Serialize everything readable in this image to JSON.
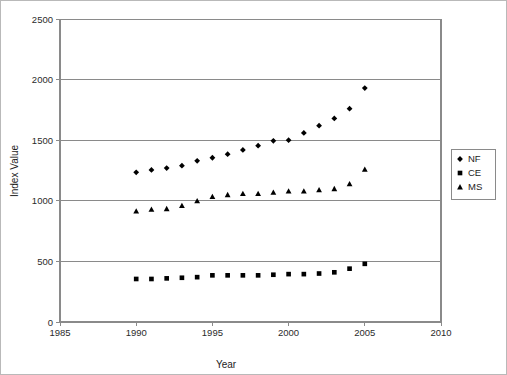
{
  "chart_data": {
    "type": "scatter",
    "title": "",
    "xlabel": "Year",
    "ylabel": "Index Value",
    "xlim": [
      1985,
      2010
    ],
    "ylim": [
      0,
      2500
    ],
    "xticks": [
      1985,
      1990,
      1995,
      2000,
      2005,
      2010
    ],
    "yticks": [
      0,
      500,
      1000,
      1500,
      2000,
      2500
    ],
    "grid": "horizontal",
    "legend_position": "right-outside",
    "x": [
      1990,
      1991,
      1992,
      1993,
      1994,
      1995,
      1996,
      1997,
      1998,
      1999,
      2000,
      2001,
      2002,
      2003,
      2004,
      2005
    ],
    "series": [
      {
        "name": "NF",
        "marker": "diamond",
        "color": "#000000",
        "values": [
          1235,
          1255,
          1270,
          1290,
          1330,
          1355,
          1385,
          1420,
          1455,
          1495,
          1500,
          1560,
          1620,
          1680,
          1760,
          1930
        ]
      },
      {
        "name": "CE",
        "marker": "square",
        "color": "#000000",
        "values": [
          355,
          355,
          360,
          365,
          370,
          385,
          385,
          385,
          385,
          390,
          395,
          395,
          400,
          410,
          440,
          480
        ]
      },
      {
        "name": "MS",
        "marker": "triangle",
        "color": "#000000",
        "values": [
          915,
          930,
          935,
          960,
          1000,
          1035,
          1050,
          1060,
          1060,
          1070,
          1080,
          1080,
          1090,
          1100,
          1140,
          1260
        ]
      }
    ]
  },
  "legend": {
    "entries": [
      {
        "label": "NF",
        "marker": "diamond"
      },
      {
        "label": "CE",
        "marker": "square"
      },
      {
        "label": "MS",
        "marker": "triangle"
      }
    ]
  }
}
